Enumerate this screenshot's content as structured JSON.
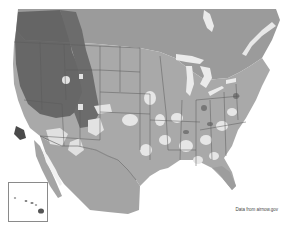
{
  "map": {
    "type": "choropleth-overlay",
    "region": "Contiguous United States with southern Canada and northern Mexico",
    "style": "grayscale",
    "inset": {
      "label": "Hawaii",
      "present": true
    },
    "caption": "Data from airnow.gov",
    "colors": {
      "background": "#ffffff",
      "ocean": "#f4f4f4",
      "land_base": "#a9a9a9",
      "canada": "#9b9b9b",
      "mexico": "#a4a4a4",
      "low_zone": "#e2e2e2",
      "high_zone": "#6e6e6e",
      "very_high_zone": "#4a4a4a",
      "water_lakes": "#e9e9e9",
      "borders": "#555555"
    }
  }
}
